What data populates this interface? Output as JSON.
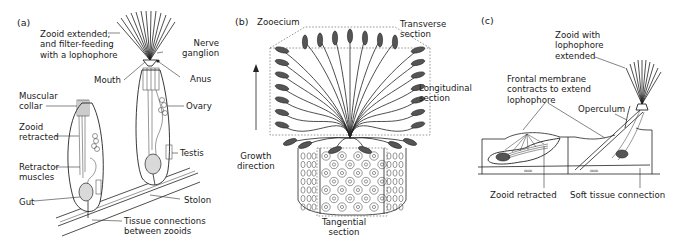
{
  "figure": {
    "panels": [
      {
        "id": "a",
        "letter": "(a)",
        "labels": {
          "zooid_extended": [
            "Zooid extended,",
            "and filter-feeding",
            "with a lophophore"
          ],
          "nerve_ganglion": [
            "Nerve",
            "ganglion"
          ],
          "mouth": "Mouth",
          "anus": "Anus",
          "muscular_collar": [
            "Muscular",
            "collar"
          ],
          "ovary": "Ovary",
          "zooid_retracted": [
            "Zooid",
            "retracted"
          ],
          "testis": "Testis",
          "retractor_muscles": [
            "Retractor",
            "muscles"
          ],
          "stolon": "Stolon",
          "gut": "Gut",
          "tissue_connections": [
            "Tissue connections",
            "between zooids"
          ]
        }
      },
      {
        "id": "b",
        "letter": "(b)",
        "labels": {
          "zooecium": "Zooecium",
          "transverse_section": [
            "Transverse",
            "section"
          ],
          "longitudinal_section": [
            "Longitudinal",
            "section"
          ],
          "growth_direction": [
            "Growth",
            "direction"
          ],
          "tangential_section": [
            "Tangential",
            "section"
          ]
        }
      },
      {
        "id": "c",
        "letter": "(c)",
        "labels": {
          "zooid_lophophore_extended": [
            "Zooid with",
            "lophophore",
            "extended"
          ],
          "frontal_membrane": [
            "Frontal membrane",
            "contracts to extend",
            "lophophore"
          ],
          "operculum": "Operculum",
          "zooid_retracted": "Zooid retracted",
          "soft_tissue_connection": "Soft tissue connection"
        }
      }
    ]
  }
}
